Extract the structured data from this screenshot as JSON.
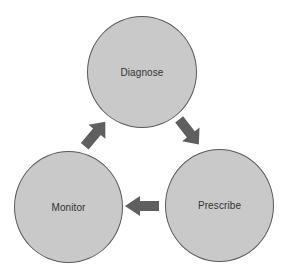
{
  "diagram": {
    "type": "cycle",
    "nodes": [
      {
        "id": "diagnose",
        "label": "Diagnose"
      },
      {
        "id": "prescribe",
        "label": "Prescribe"
      },
      {
        "id": "monitor",
        "label": "Monitor"
      }
    ],
    "edges": [
      {
        "from": "diagnose",
        "to": "prescribe",
        "icon": "arrow-down-right-icon"
      },
      {
        "from": "prescribe",
        "to": "monitor",
        "icon": "arrow-left-icon"
      },
      {
        "from": "monitor",
        "to": "diagnose",
        "icon": "arrow-up-right-icon"
      }
    ],
    "colors": {
      "node_fill": "#c9c9c9",
      "node_border": "#5a5a5a",
      "arrow_fill": "#5f5f5f",
      "text": "#333333",
      "background": "#ffffff"
    }
  }
}
